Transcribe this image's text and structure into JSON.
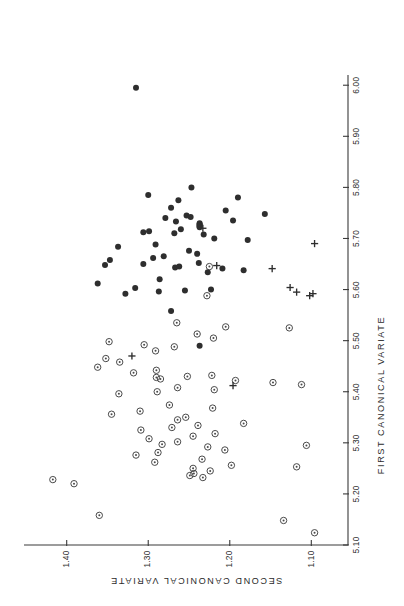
{
  "figure": {
    "orientation": "rotated-90-ccw",
    "background_color": "#ffffff",
    "ink_color": "#2e2e2e"
  },
  "chart_data": {
    "type": "scatter",
    "title": "",
    "xlabel": "FIRST CANONICAL VARIATE",
    "ylabel": "SECOND CANONICAL VARIATE",
    "xlim": [
      5.1,
      6.02
    ],
    "ylim": [
      1.055,
      1.445
    ],
    "xticks": [
      5.1,
      5.2,
      5.3,
      5.4,
      5.5,
      5.6,
      5.7,
      5.8,
      5.9,
      6.0
    ],
    "xtick_labels": [
      "5.10",
      "5.20",
      "5.30",
      "5.40",
      "5.50",
      "5.60",
      "5.70",
      "5.80",
      "5.90",
      "6.00"
    ],
    "yticks": [
      1.1,
      1.2,
      1.3,
      1.4
    ],
    "ytick_labels": [
      "1.10",
      "1.20",
      "1.30",
      "1.40"
    ],
    "grid": false,
    "legend": "none",
    "series": [
      {
        "name": "filled-circle-group",
        "marker": "filled-circle",
        "color": "#2e2e2e",
        "points": [
          [
            5.995,
            1.315
          ],
          [
            5.8,
            1.247
          ],
          [
            5.785,
            1.3
          ],
          [
            5.78,
            1.19
          ],
          [
            5.775,
            1.263
          ],
          [
            5.76,
            1.272
          ],
          [
            5.755,
            1.205
          ],
          [
            5.748,
            1.157
          ],
          [
            5.745,
            1.253
          ],
          [
            5.742,
            1.248
          ],
          [
            5.74,
            1.279
          ],
          [
            5.735,
            1.196
          ],
          [
            5.733,
            1.266
          ],
          [
            5.73,
            1.237
          ],
          [
            5.728,
            1.237
          ],
          [
            5.726,
            1.237
          ],
          [
            5.724,
            1.237
          ],
          [
            5.722,
            1.237
          ],
          [
            5.718,
            1.26
          ],
          [
            5.714,
            1.299
          ],
          [
            5.712,
            1.306
          ],
          [
            5.71,
            1.268
          ],
          [
            5.708,
            1.232
          ],
          [
            5.7,
            1.219
          ],
          [
            5.697,
            1.178
          ],
          [
            5.688,
            1.291
          ],
          [
            5.684,
            1.337
          ],
          [
            5.676,
            1.25
          ],
          [
            5.67,
            1.24
          ],
          [
            5.665,
            1.281
          ],
          [
            5.662,
            1.294
          ],
          [
            5.658,
            1.347
          ],
          [
            5.652,
            1.238
          ],
          [
            5.65,
            1.306
          ],
          [
            5.648,
            1.353
          ],
          [
            5.645,
            1.262
          ],
          [
            5.643,
            1.267
          ],
          [
            5.641,
            1.209
          ],
          [
            5.638,
            1.183
          ],
          [
            5.634,
            1.227
          ],
          [
            5.62,
            1.286
          ],
          [
            5.612,
            1.362
          ],
          [
            5.603,
            1.316
          ],
          [
            5.6,
            1.223
          ],
          [
            5.598,
            1.255
          ],
          [
            5.596,
            1.287
          ],
          [
            5.592,
            1.328
          ],
          [
            5.558,
            1.272
          ],
          [
            5.49,
            1.237
          ]
        ]
      },
      {
        "name": "open-circle-group",
        "marker": "circled-dot",
        "color": "#4a4a4a",
        "points": [
          [
            5.645,
            1.225
          ],
          [
            5.588,
            1.228
          ],
          [
            5.535,
            1.265
          ],
          [
            5.527,
            1.205
          ],
          [
            5.525,
            1.127
          ],
          [
            5.513,
            1.24
          ],
          [
            5.505,
            1.22
          ],
          [
            5.498,
            1.348
          ],
          [
            5.492,
            1.305
          ],
          [
            5.488,
            1.268
          ],
          [
            5.48,
            1.291
          ],
          [
            5.465,
            1.352
          ],
          [
            5.458,
            1.335
          ],
          [
            5.448,
            1.362
          ],
          [
            5.442,
            1.29
          ],
          [
            5.437,
            1.318
          ],
          [
            5.432,
            1.222
          ],
          [
            5.43,
            1.252
          ],
          [
            5.428,
            1.29
          ],
          [
            5.425,
            1.285
          ],
          [
            5.422,
            1.193
          ],
          [
            5.418,
            1.147
          ],
          [
            5.414,
            1.112
          ],
          [
            5.408,
            1.264
          ],
          [
            5.404,
            1.219
          ],
          [
            5.4,
            1.289
          ],
          [
            5.396,
            1.336
          ],
          [
            5.374,
            1.274
          ],
          [
            5.368,
            1.221
          ],
          [
            5.362,
            1.31
          ],
          [
            5.356,
            1.345
          ],
          [
            5.35,
            1.254
          ],
          [
            5.345,
            1.264
          ],
          [
            5.338,
            1.183
          ],
          [
            5.334,
            1.239
          ],
          [
            5.33,
            1.271
          ],
          [
            5.325,
            1.309
          ],
          [
            5.318,
            1.218
          ],
          [
            5.313,
            1.245
          ],
          [
            5.308,
            1.299
          ],
          [
            5.302,
            1.264
          ],
          [
            5.297,
            1.283
          ],
          [
            5.292,
            1.227
          ],
          [
            5.286,
            1.206
          ],
          [
            5.281,
            1.288
          ],
          [
            5.276,
            1.315
          ],
          [
            5.268,
            1.234
          ],
          [
            5.262,
            1.292
          ],
          [
            5.256,
            1.198
          ],
          [
            5.25,
            1.245
          ],
          [
            5.245,
            1.224
          ],
          [
            5.24,
            1.244
          ],
          [
            5.236,
            1.249
          ],
          [
            5.232,
            1.233
          ],
          [
            5.228,
            1.417
          ],
          [
            5.22,
            1.391
          ],
          [
            5.295,
            1.106
          ],
          [
            5.253,
            1.118
          ],
          [
            5.158,
            1.36
          ],
          [
            5.148,
            1.134
          ],
          [
            5.124,
            1.096
          ]
        ]
      },
      {
        "name": "plus-group",
        "marker": "plus",
        "color": "#2e2e2e",
        "points": [
          [
            5.72,
            1.233
          ],
          [
            5.69,
            1.096
          ],
          [
            5.647,
            1.216
          ],
          [
            5.641,
            1.148
          ],
          [
            5.604,
            1.126
          ],
          [
            5.595,
            1.118
          ],
          [
            5.592,
            1.098
          ],
          [
            5.588,
            1.102
          ],
          [
            5.47,
            1.32
          ],
          [
            5.412,
            1.196
          ]
        ]
      }
    ]
  },
  "axes": {
    "x_axis_name": "first-canonical-variate-axis",
    "y_axis_name": "second-canonical-variate-axis"
  }
}
